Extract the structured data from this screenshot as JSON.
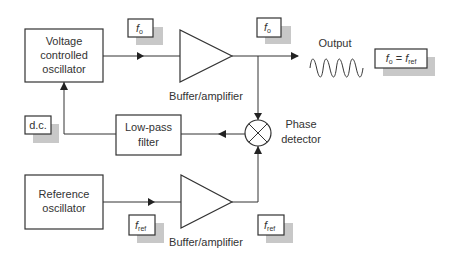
{
  "diagram": {
    "blocks": {
      "vco": {
        "line1": "Voltage",
        "line2": "controlled",
        "line3": "oscillator"
      },
      "lowpass": {
        "line1": "Low-pass",
        "line2": "filter"
      },
      "reference": {
        "line1": "Reference",
        "line2": "oscillator"
      },
      "buffer_top": {
        "label": "Buffer/amplifier"
      },
      "buffer_bottom": {
        "label": "Buffer/amplifier"
      },
      "phase_detector": {
        "line1": "Phase",
        "line2": "detector"
      }
    },
    "tags": {
      "f0_a": {
        "sym": "f",
        "sub": "o"
      },
      "f0_b": {
        "sym": "f",
        "sub": "o"
      },
      "fref_a": {
        "sym": "f",
        "sub": "ref"
      },
      "fref_b": {
        "sym": "f",
        "sub": "ref"
      },
      "dc": {
        "text": "d.c."
      },
      "lock": {
        "sym1": "f",
        "sub1": "o",
        "eq": " = ",
        "sym2": "f",
        "sub2": "ref"
      }
    },
    "output": {
      "label": "Output",
      "waveform": "sine-wave-icon"
    },
    "colors": {
      "stroke": "#333333",
      "shadow": "#c8c8c8",
      "background": "#ffffff"
    }
  }
}
